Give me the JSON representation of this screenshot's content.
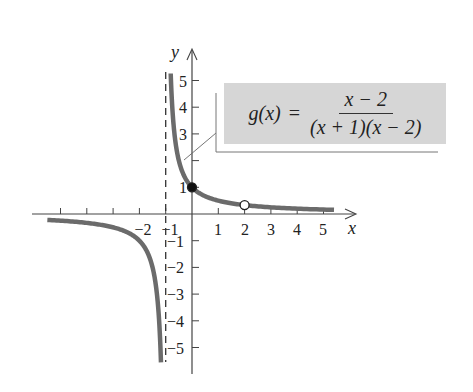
{
  "chart_data": {
    "type": "line",
    "title": "",
    "function_label": "g(x) = (x − 2) / ((x + 1)(x − 2))",
    "formula": {
      "lhs": "g(x)",
      "equals": "=",
      "numerator": "x − 2",
      "denominator": "(x + 1)(x − 2)"
    },
    "xlabel": "x",
    "ylabel": "y",
    "xlim": [
      -5.7,
      6.1
    ],
    "ylim": [
      -5.8,
      6.0
    ],
    "x_ticks": [
      -5,
      -4,
      -3,
      -2,
      -1,
      1,
      2,
      3,
      4,
      5
    ],
    "x_tick_labels": [
      "-2",
      "-1",
      "1",
      "2",
      "3",
      "4",
      "5"
    ],
    "y_ticks": [
      -5,
      -4,
      -3,
      -2,
      -1,
      1,
      2,
      3,
      4,
      5
    ],
    "y_tick_labels": [
      "5",
      "4",
      "3",
      "1",
      "-1",
      "-2",
      "-3",
      "-4",
      "-5"
    ],
    "grid": false,
    "vertical_asymptote": {
      "x": -1,
      "style": "dashed"
    },
    "series": [
      {
        "name": "g(x) right branch",
        "x": [
          -0.81,
          -0.75,
          -0.7,
          -0.6,
          -0.5,
          -0.4,
          -0.3,
          -0.2,
          0,
          0.5,
          1,
          1.5,
          2,
          3,
          4,
          5,
          5.4
        ],
        "values": [
          5.26,
          4.0,
          3.33,
          2.5,
          2.0,
          1.67,
          1.43,
          1.25,
          1.0,
          0.67,
          0.5,
          0.4,
          0.33,
          0.25,
          0.2,
          0.17,
          0.16
        ]
      },
      {
        "name": "g(x) left branch",
        "x": [
          -5.5,
          -5,
          -4,
          -3,
          -2.5,
          -2,
          -1.6,
          -1.4,
          -1.3,
          -1.25,
          -1.2,
          -1.18
        ],
        "values": [
          -0.22,
          -0.25,
          -0.33,
          -0.5,
          -0.67,
          -1.0,
          -1.67,
          -2.5,
          -3.33,
          -4.0,
          -5.0,
          -5.56
        ]
      }
    ],
    "points": [
      {
        "x": 0,
        "y": 1,
        "type": "closed",
        "label": "y-intercept (0, 1)"
      },
      {
        "x": 2,
        "y": 0.333,
        "type": "open",
        "label": "hole (2, 1/3)"
      }
    ],
    "colors": {
      "curve": "#6b6b6b",
      "axis": "#444444",
      "formula_box": "#d6d6d6",
      "text": "#222222"
    }
  }
}
